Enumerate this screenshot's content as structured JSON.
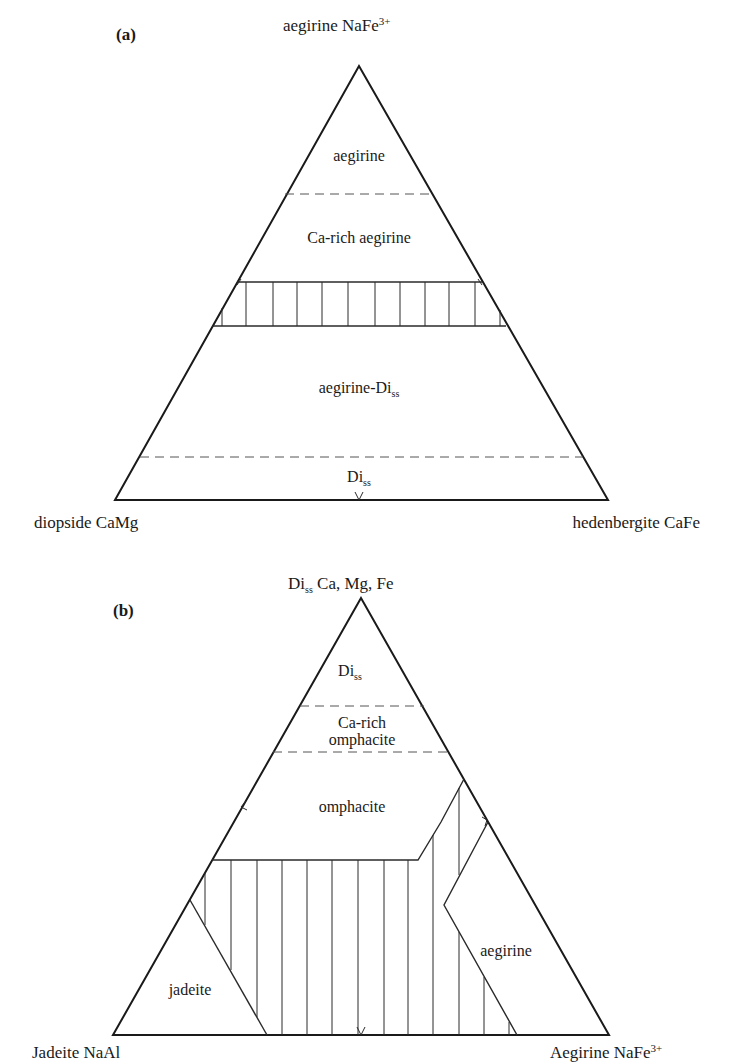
{
  "figure_a": {
    "panel_label": "(a)",
    "apex_label": "aegirine NaFe",
    "apex_label_sup": "3+",
    "left_label": "diopside CaMg",
    "right_label": "hedenbergite CaFe",
    "regions": {
      "aegirine": "aegirine",
      "ca_rich_aegirine": "Ca-rich aegirine",
      "aegirine_di": "aegirine-Di",
      "aegirine_di_sub": "ss",
      "di": "Di",
      "di_sub": "ss"
    }
  },
  "figure_b": {
    "panel_label": "(b)",
    "apex_label_pre": "Di",
    "apex_label_sub": "ss",
    "apex_label_post": " Ca, Mg, Fe",
    "left_label": "Jadeite NaAl",
    "right_label": "Aegirine NaFe",
    "right_label_sup": "3+",
    "regions": {
      "di": "Di",
      "di_sub": "ss",
      "ca_rich_omphacite_1": "Ca-rich",
      "ca_rich_omphacite_2": "omphacite",
      "omphacite": "omphacite",
      "jadeite": "jadeite",
      "aegirine": "aegirine"
    }
  },
  "colors": {
    "line": "#1a1a1a",
    "dash": "#555555",
    "background": "#ffffff"
  }
}
